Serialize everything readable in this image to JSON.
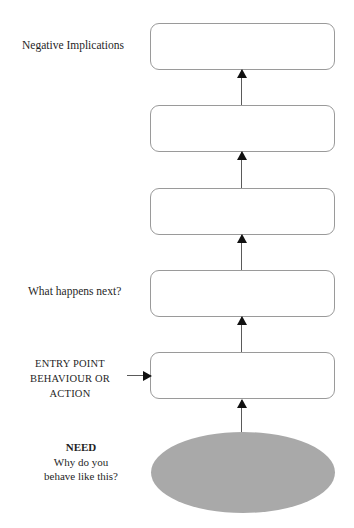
{
  "diagram": {
    "colors": {
      "box_border": "#9a9a9a",
      "box_fill": "#ffffff",
      "ellipse_fill": "#a9a9a9",
      "arrow": "#111111",
      "text": "#1f1f1f",
      "background": "#ffffff"
    },
    "boxes": [
      {
        "id": "box-1",
        "label": "",
        "top": 23
      },
      {
        "id": "box-2",
        "label": "",
        "top": 105
      },
      {
        "id": "box-3",
        "label": "",
        "top": 188
      },
      {
        "id": "box-4",
        "label": "",
        "top": 270
      },
      {
        "id": "box-5",
        "label": "",
        "top": 352
      }
    ],
    "arrows": [
      {
        "id": "arrow-box2-to-box1",
        "direction": "up",
        "top": 70,
        "height": 35
      },
      {
        "id": "arrow-box3-to-box2",
        "direction": "up",
        "top": 152,
        "height": 36
      },
      {
        "id": "arrow-box4-to-box3",
        "direction": "up",
        "top": 235,
        "height": 35
      },
      {
        "id": "arrow-box5-to-box4",
        "direction": "up",
        "top": 317,
        "height": 35
      },
      {
        "id": "arrow-need-to-box5",
        "direction": "up",
        "top": 400,
        "height": 36
      }
    ],
    "entry_arrow": {
      "id": "arrow-entry-point",
      "direction": "right"
    },
    "labels": {
      "negative_implications": "Negative Implications",
      "what_happens_next": "What happens next?",
      "entry_point": {
        "line1": "ENTRY POINT",
        "line2": "BEHAVIOUR OR",
        "line3": "ACTION"
      },
      "need": {
        "title": "NEED",
        "line1": "Why do you",
        "line2": "behave like this?"
      }
    }
  }
}
